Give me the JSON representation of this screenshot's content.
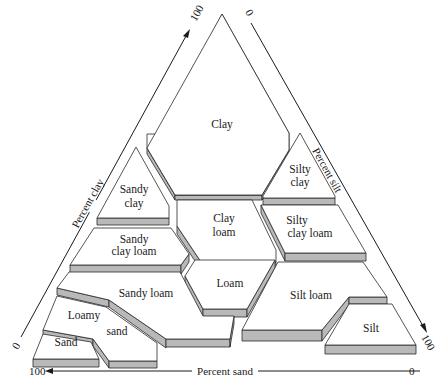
{
  "diagram": {
    "axes": {
      "clay": {
        "label": "Percent clay",
        "min_label": "0",
        "max_label": "100"
      },
      "silt": {
        "label": "Percent silt",
        "min_label": "0",
        "max_label": "100"
      },
      "sand": {
        "label": "Percent sand",
        "min_label": "0",
        "max_label": "100"
      }
    },
    "classes": {
      "clay": "Clay",
      "sandy_clay_1": "Sandy",
      "sandy_clay_2": "clay",
      "silty_clay_1": "Silty",
      "silty_clay_2": "clay",
      "clay_loam_1": "Clay",
      "clay_loam_2": "loam",
      "sandy_clay_loam_1": "Sandy",
      "sandy_clay_loam_2": "clay loam",
      "silty_clay_loam_1": "Silty",
      "silty_clay_loam_2": "clay loam",
      "loam": "Loam",
      "sandy_loam": "Sandy loam",
      "silt_loam": "Silt loam",
      "loamy_sand_1": "Loamy",
      "loamy_sand_2": "sand",
      "sand": "Sand",
      "silt": "Silt"
    },
    "colors": {
      "face": "#ffffff",
      "side": "#b9b9b9",
      "line": "#2a2a2a"
    }
  }
}
